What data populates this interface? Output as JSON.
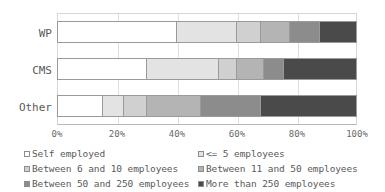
{
  "chart_data": {
    "type": "bar",
    "orientation": "horizontal",
    "stacked": true,
    "normalized": true,
    "title": "",
    "subtitle": "",
    "xlabel": "",
    "ylabel": "",
    "xlim": [
      0,
      100
    ],
    "xticks": [
      "0%",
      "20%",
      "40%",
      "60%",
      "80%",
      "100%"
    ],
    "xtick_values": [
      0,
      20,
      40,
      60,
      80,
      100
    ],
    "grid": true,
    "grid_axis": "x",
    "legend_position": "bottom",
    "categories": [
      "WP",
      "CMS",
      "Other"
    ],
    "series": [
      {
        "name": "Self employed",
        "color": "#ffffff",
        "values": [
          40,
          30,
          15
        ]
      },
      {
        "name": "<= 5 employees",
        "color": "#e3e3e3",
        "values": [
          20,
          24,
          7
        ]
      },
      {
        "name": "Between 6 and 10 employees",
        "color": "#d0d0d0",
        "values": [
          8,
          6,
          8
        ]
      },
      {
        "name": "Between 11 and 50 employees",
        "color": "#b4b4b4",
        "values": [
          10,
          9,
          18
        ]
      },
      {
        "name": "Between 50 and 250 employees",
        "color": "#8c8c8c",
        "values": [
          10,
          7,
          20
        ]
      },
      {
        "name": "More than 250 employees",
        "color": "#4a4a4a",
        "values": [
          12,
          24,
          32
        ]
      }
    ]
  },
  "axis": {
    "ticks": [
      {
        "label": "0%",
        "value": 0
      },
      {
        "label": "20%",
        "value": 20
      },
      {
        "label": "40%",
        "value": 40
      },
      {
        "label": "60%",
        "value": 60
      },
      {
        "label": "80%",
        "value": 80
      },
      {
        "label": "100%",
        "value": 100
      }
    ]
  },
  "categories": [
    {
      "label": "WP"
    },
    {
      "label": "CMS"
    },
    {
      "label": "Other"
    }
  ],
  "legend": {
    "items": [
      {
        "label": "Self employed",
        "color": "#ffffff"
      },
      {
        "label": "<= 5 employees",
        "color": "#e3e3e3"
      },
      {
        "label": "Between 6 and 10 employees",
        "color": "#d0d0d0"
      },
      {
        "label": "Between 11 and 50 employees",
        "color": "#b4b4b4"
      },
      {
        "label": "Between 50 and 250 employees",
        "color": "#8c8c8c"
      },
      {
        "label": "More than 250 employees",
        "color": "#4a4a4a"
      }
    ]
  }
}
